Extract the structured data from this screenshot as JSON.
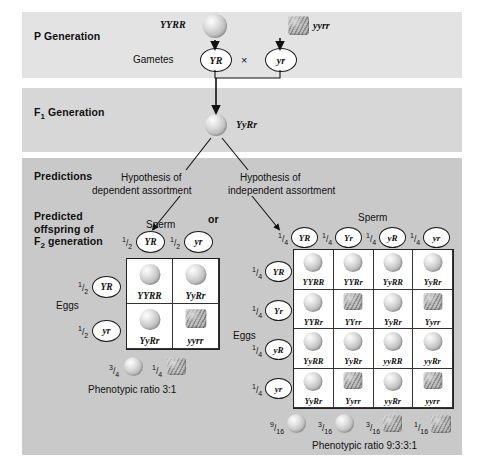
{
  "sections": {
    "p_generation": {
      "label": "P Generation",
      "parent_left_genotype": "YYRR",
      "parent_left_phenotype": "round-yellow-seed",
      "parent_right_genotype": "yyrr",
      "parent_right_phenotype": "wrinkled-green-seed",
      "gametes_label": "Gametes",
      "gamete_left": "YR",
      "cross_symbol": "×",
      "gamete_right": "yr"
    },
    "f1_generation": {
      "label": "F<sub>1</sub> Generation",
      "label_plain": "F1 Generation",
      "genotype": "YyRr",
      "phenotype": "round-yellow-seed"
    },
    "predictions": {
      "label": "Predictions",
      "predicted_offspring_label": "Predicted offspring of F2 generation",
      "predicted_offspring_line1": "Predicted",
      "predicted_offspring_line2": "offspring of",
      "predicted_offspring_line3_pre": "F",
      "predicted_offspring_line3_sub": "2",
      "predicted_offspring_line3_post": " generation",
      "hypothesis_left_line1": "Hypothesis of",
      "hypothesis_left_line2": "dependent assortment",
      "hypothesis_right_line1": "Hypothesis of",
      "hypothesis_right_line2": "independent assortment",
      "or_label": "or"
    }
  },
  "dependent_square": {
    "sperm_label": "Sperm",
    "eggs_label": "Eggs",
    "sperm_gametes": [
      {
        "fraction_num": "1",
        "fraction_den": "2",
        "allele": "YR"
      },
      {
        "fraction_num": "1",
        "fraction_den": "2",
        "allele": "yr"
      }
    ],
    "egg_gametes": [
      {
        "fraction_num": "1",
        "fraction_den": "2",
        "allele": "YR"
      },
      {
        "fraction_num": "1",
        "fraction_den": "2",
        "allele": "yr"
      }
    ],
    "cells": [
      {
        "genotype": "YYRR",
        "phenotype": "round"
      },
      {
        "genotype": "YyRr",
        "phenotype": "round"
      },
      {
        "genotype": "YyRr",
        "phenotype": "round"
      },
      {
        "genotype": "yyrr",
        "phenotype": "wrinkled"
      }
    ],
    "summary": [
      {
        "fraction_num": "3",
        "fraction_den": "4",
        "phenotype": "round"
      },
      {
        "fraction_num": "1",
        "fraction_den": "4",
        "phenotype": "wrinkled"
      }
    ],
    "ratio_text": "Phenotypic ratio 3:1"
  },
  "independent_square": {
    "sperm_label": "Sperm",
    "eggs_label": "Eggs",
    "sperm_gametes": [
      {
        "fraction_num": "1",
        "fraction_den": "4",
        "allele": "YR"
      },
      {
        "fraction_num": "1",
        "fraction_den": "4",
        "allele": "Yr"
      },
      {
        "fraction_num": "1",
        "fraction_den": "4",
        "allele": "yR"
      },
      {
        "fraction_num": "1",
        "fraction_den": "4",
        "allele": "yr"
      }
    ],
    "egg_gametes": [
      {
        "fraction_num": "1",
        "fraction_den": "4",
        "allele": "YR"
      },
      {
        "fraction_num": "1",
        "fraction_den": "4",
        "allele": "Yr"
      },
      {
        "fraction_num": "1",
        "fraction_den": "4",
        "allele": "yR"
      },
      {
        "fraction_num": "1",
        "fraction_den": "4",
        "allele": "yr"
      }
    ],
    "cells": [
      {
        "genotype": "YYRR",
        "phenotype": "round"
      },
      {
        "genotype": "YYRr",
        "phenotype": "round"
      },
      {
        "genotype": "YyRR",
        "phenotype": "round"
      },
      {
        "genotype": "YyRr",
        "phenotype": "round"
      },
      {
        "genotype": "YYRr",
        "phenotype": "round"
      },
      {
        "genotype": "YYrr",
        "phenotype": "wrinkled"
      },
      {
        "genotype": "YyRr",
        "phenotype": "round"
      },
      {
        "genotype": "Yyrr",
        "phenotype": "wrinkled"
      },
      {
        "genotype": "YyRR",
        "phenotype": "round"
      },
      {
        "genotype": "YyRr",
        "phenotype": "round"
      },
      {
        "genotype": "yyRR",
        "phenotype": "round"
      },
      {
        "genotype": "yyRr",
        "phenotype": "round"
      },
      {
        "genotype": "YyRr",
        "phenotype": "round"
      },
      {
        "genotype": "Yyrr",
        "phenotype": "wrinkled"
      },
      {
        "genotype": "yyRr",
        "phenotype": "round"
      },
      {
        "genotype": "yyrr",
        "phenotype": "wrinkled"
      }
    ],
    "summary": [
      {
        "fraction_num": "9",
        "fraction_den": "16",
        "phenotype": "round"
      },
      {
        "fraction_num": "3",
        "fraction_den": "16",
        "phenotype": "round"
      },
      {
        "fraction_num": "3",
        "fraction_den": "16",
        "phenotype": "wrinkled"
      },
      {
        "fraction_num": "1",
        "fraction_den": "16",
        "phenotype": "wrinkled"
      }
    ],
    "ratio_text": "Phenotypic ratio 9:3:3:1"
  },
  "colors": {
    "band_p": "#e3e3e3",
    "band_f1": "#d7d7d7",
    "band_predictions": "#c9c9c9",
    "ink": "#111111",
    "cell_bg": "#ffffff"
  }
}
